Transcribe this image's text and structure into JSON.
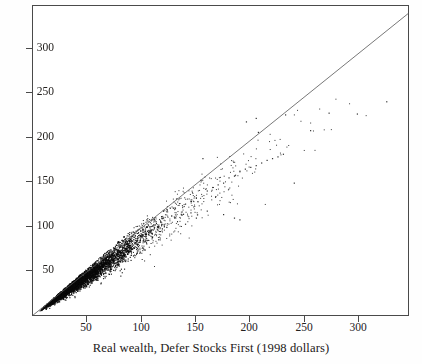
{
  "figure": {
    "background": "#fefefe",
    "plot_background": "#ffffff",
    "frame_color": "#4a4a4a",
    "point_color": "#0a0a0a",
    "line_color": "#555555"
  },
  "chart_data": {
    "type": "scatter",
    "title": "",
    "subtitle": "",
    "xlabel": "Real wealth, Defer Stocks First (1998 dollars)",
    "ylabel": "",
    "xlim": [
      -0.6,
      346
    ],
    "ylim": [
      -0.6,
      355
    ],
    "grid": false,
    "legend": null,
    "xticks": [
      50,
      100,
      150,
      200,
      250,
      300
    ],
    "xtick_labels": [
      "50",
      "100",
      "150",
      "200",
      "250",
      "300"
    ],
    "yticks": [
      50,
      100,
      150,
      200,
      250,
      300
    ],
    "ytick_labels": [
      "50",
      "100",
      "150",
      "200",
      "250",
      "300"
    ],
    "annotations": [
      {
        "name": "identity-line",
        "kind": "reference-line",
        "description": "45 degree y = x diagonal drawn corner to corner",
        "from": [
          0,
          0
        ],
        "to": [
          346,
          346
        ]
      }
    ],
    "series": [
      {
        "name": "Real wealth pairs",
        "marker": "dot",
        "marker_size": 1,
        "color": "#0a0a0a",
        "n_points": 4200,
        "description": "Dense elongated cloud along the identity line; mass concentrated below x=100, fanning out and skewed below the diagonal at higher wealth levels, with sparse outliers out to x=325",
        "distribution": {
          "x_lognormal_median": 48,
          "x_lognormal_sigma": 0.62,
          "y_over_x_mean": 0.93,
          "y_over_x_sigma": 0.085,
          "x_max": 330,
          "y_max": 250
        },
        "sample_points": [
          [
            5,
            5
          ],
          [
            8,
            8
          ],
          [
            10,
            9
          ],
          [
            12,
            11
          ],
          [
            14,
            13
          ],
          [
            16,
            15
          ],
          [
            18,
            17
          ],
          [
            20,
            19
          ],
          [
            22,
            20
          ],
          [
            25,
            23
          ],
          [
            28,
            26
          ],
          [
            30,
            28
          ],
          [
            32,
            30
          ],
          [
            35,
            33
          ],
          [
            38,
            35
          ],
          [
            40,
            38
          ],
          [
            42,
            39
          ],
          [
            45,
            42
          ],
          [
            48,
            45
          ],
          [
            50,
            47
          ],
          [
            52,
            48
          ],
          [
            55,
            51
          ],
          [
            58,
            54
          ],
          [
            60,
            56
          ],
          [
            62,
            57
          ],
          [
            65,
            60
          ],
          [
            68,
            63
          ],
          [
            70,
            64
          ],
          [
            75,
            69
          ],
          [
            78,
            72
          ],
          [
            80,
            74
          ],
          [
            85,
            79
          ],
          [
            88,
            81
          ],
          [
            90,
            83
          ],
          [
            95,
            87
          ],
          [
            98,
            90
          ],
          [
            100,
            92
          ],
          [
            105,
            96
          ],
          [
            110,
            101
          ],
          [
            115,
            105
          ],
          [
            120,
            110
          ],
          [
            125,
            114
          ],
          [
            130,
            119
          ],
          [
            135,
            123
          ],
          [
            140,
            128
          ],
          [
            145,
            131
          ],
          [
            150,
            135
          ],
          [
            160,
            143
          ],
          [
            165,
            147
          ],
          [
            170,
            150
          ],
          [
            175,
            152
          ],
          [
            180,
            158
          ],
          [
            185,
            160
          ],
          [
            190,
            165
          ],
          [
            195,
            168
          ],
          [
            200,
            170
          ],
          [
            205,
            172
          ],
          [
            210,
            175
          ],
          [
            215,
            178
          ],
          [
            220,
            180
          ],
          [
            225,
            182
          ],
          [
            230,
            185
          ],
          [
            156,
            180
          ],
          [
            196,
            222
          ],
          [
            205,
            226
          ],
          [
            207,
            210
          ],
          [
            232,
            230
          ],
          [
            240,
            152
          ],
          [
            255,
            212
          ],
          [
            272,
            232
          ],
          [
            298,
            231
          ],
          [
            325,
            245
          ],
          [
            145,
            118
          ],
          [
            160,
            120
          ],
          [
            175,
            116
          ],
          [
            185,
            112
          ],
          [
            190,
            110
          ],
          [
            110,
            90
          ],
          [
            120,
            95
          ],
          [
            130,
            100
          ],
          [
            140,
            105
          ],
          [
            150,
            112
          ]
        ]
      }
    ]
  }
}
